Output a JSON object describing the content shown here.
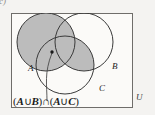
{
  "figure": {
    "part_label": "c)",
    "universe_label": "U",
    "expression": "(A∪B)∩(A∪C)",
    "expression_parts": {
      "open1": "(",
      "a1": "A",
      "union1": "∪",
      "b": "B",
      "close1": ")",
      "intersect": "∩",
      "open2": "(",
      "a2": "A",
      "union2": "∪",
      "c": "C",
      "close2": ")"
    },
    "sets": [
      {
        "label": "A",
        "shaded": true
      },
      {
        "label": "B",
        "shaded": false
      },
      {
        "label": "C",
        "shaded": false
      }
    ],
    "shading": {
      "description": "A ∪ (B ∩ C)",
      "fill_color": "#bcbcbc",
      "stroke_color": "#3a3a3a"
    },
    "colors": {
      "page_background": "#f3f2f0",
      "box_background": "#fbfaf8",
      "box_border": "#6f6d6a",
      "circle_stroke": "#3a3a3a",
      "shade_fill": "#bcbcbc",
      "text": "#1a1a1a",
      "leader_line": "#4a4a4a"
    },
    "leader": {
      "description": "curved leader line from expression to dot inside set A",
      "dot_x": 52,
      "dot_y": 52
    },
    "geometry": {
      "box": {
        "x": 11,
        "y": 13,
        "w": 122,
        "h": 95
      },
      "circles": [
        {
          "label": "A",
          "cx": 46,
          "cy": 42,
          "r": 29
        },
        {
          "label": "B",
          "cx": 84,
          "cy": 42,
          "r": 29
        },
        {
          "label": "C",
          "cx": 65,
          "cy": 65,
          "r": 29
        }
      ]
    }
  }
}
